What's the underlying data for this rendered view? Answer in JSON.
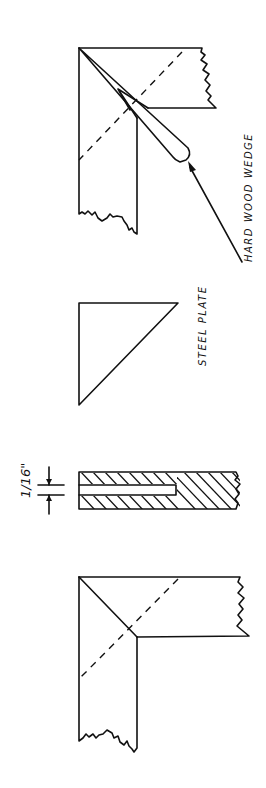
{
  "diagram": {
    "orientation": "rotated 90 degrees counter-clockwise",
    "colors": {
      "ink": "#111111",
      "background": "#ffffff"
    },
    "figures": [
      {
        "id": "wedged-miter-joint",
        "description": "Miter joint with hard wood wedge driven into corner"
      },
      {
        "id": "steel-plate",
        "description": "Triangular steel plate"
      },
      {
        "id": "slotted-section",
        "description": "Hatched section with slot"
      },
      {
        "id": "plain-miter-joint",
        "description": "Plain miter joint with dashed diagonal"
      }
    ],
    "labels": {
      "wedge": "HARD   WOOD  WEDGE",
      "plate": "STEEL  PLATE",
      "slot_dimension": "1/16\""
    }
  }
}
